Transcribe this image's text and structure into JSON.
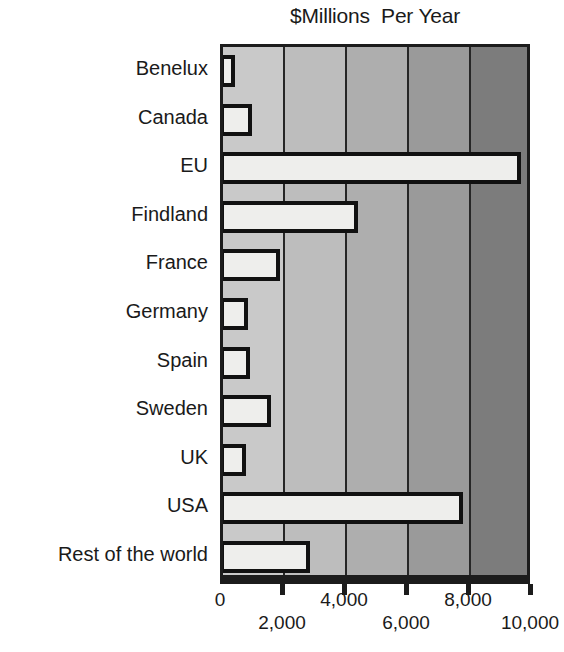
{
  "chart_data": {
    "type": "bar",
    "orientation": "horizontal",
    "title": "$Millions  Per Year",
    "xlabel": "",
    "ylabel": "",
    "xlim": [
      0,
      10000
    ],
    "xticks": [
      0,
      2000,
      4000,
      6000,
      8000,
      10000
    ],
    "xtick_labels": [
      "0",
      "2,000",
      "4,000",
      "6,000",
      "8,000",
      "10,000"
    ],
    "xtick_label_rows": [
      "a",
      "b",
      "a",
      "b",
      "a",
      "b"
    ],
    "grid": true,
    "gridlines_at": [
      2000,
      4000,
      6000,
      8000
    ],
    "legend": null,
    "categories": [
      "Benelux",
      "Canada",
      "EU",
      "Findland",
      "France",
      "Germany",
      "Spain",
      "Sweden",
      "UK",
      "USA",
      "Rest of the world"
    ],
    "values": [
      400,
      950,
      9600,
      4350,
      1850,
      800,
      870,
      1550,
      730,
      7750,
      2800
    ],
    "bar_style": {
      "fill": "#eeeeec",
      "outline": "#111111",
      "outline_width_px": 4
    },
    "background_bands": [
      {
        "from": 0,
        "to": 2000,
        "color": "#c9c9c9"
      },
      {
        "from": 2000,
        "to": 4000,
        "color": "#bdbdbd"
      },
      {
        "from": 4000,
        "to": 6000,
        "color": "#aeaeae"
      },
      {
        "from": 6000,
        "to": 8000,
        "color": "#9a9a9a"
      },
      {
        "from": 8000,
        "to": 10000,
        "color": "#7c7c7c"
      }
    ],
    "frame_color": "#1c1c1c",
    "axis_color": "#1c1c1c",
    "plot_background_gradient": "light-gray-to-dark-gray-left-to-right"
  },
  "page": {
    "bleed_text": "bottom page text partially cropped"
  }
}
